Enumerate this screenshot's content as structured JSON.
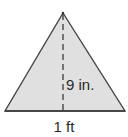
{
  "diagram": {
    "shape": "triangle",
    "fill_color": "#e0e0e0",
    "stroke_color": "#444444",
    "apex": [
      63,
      13
    ],
    "base_left": [
      5,
      111
    ],
    "base_right": [
      125,
      111
    ],
    "altitude": {
      "style": "dashed",
      "from": [
        63,
        13
      ],
      "to": [
        63,
        111
      ]
    },
    "labels": {
      "height": "9 in.",
      "base": "1 ft"
    }
  }
}
